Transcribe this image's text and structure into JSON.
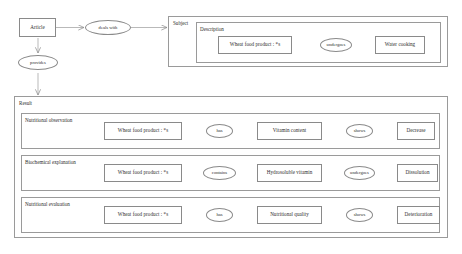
{
  "diagram": {
    "stroke_color": "#8a8a8a",
    "panel_stroke_color": "#9a9a9a",
    "text_color": "#2d2d2d",
    "background": "#ffffff"
  },
  "top": {
    "article_node": "Article",
    "deals_with_edge": "deals with",
    "provides_edge": "provides",
    "subject_panel_label": "Subject",
    "description_panel_label": "Description",
    "description_subject": "Wheat food product : *s",
    "description_relation": "undergoes",
    "description_object": "Water cooking"
  },
  "result": {
    "panel_label": "Result",
    "rows": [
      {
        "label": "Nutritional observation",
        "subject": "Wheat food product : *s",
        "relation1": "has",
        "object1": "Vitamin content",
        "relation2": "shows",
        "object2": "Decrease"
      },
      {
        "label": "Biochemical explanation",
        "subject": "Wheat food product : *s",
        "relation1": "contains",
        "object1": "Hydrosoluble vitamin",
        "relation2": "undergoes",
        "object2": "Dissolution"
      },
      {
        "label": "Nutritional evaluation",
        "subject": "Wheat food product : *s",
        "relation1": "has",
        "object1": "Nutritional quality",
        "relation2": "shows",
        "object2": "Deterioration"
      }
    ]
  }
}
